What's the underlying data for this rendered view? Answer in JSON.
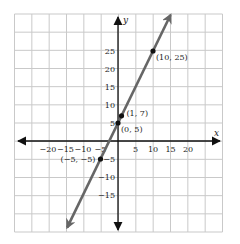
{
  "chart_data": {
    "type": "line",
    "title": "",
    "xlabel": "x",
    "ylabel": "y",
    "xlim": [
      -29,
      30
    ],
    "ylim": [
      -26,
      36
    ],
    "grid": true,
    "legend": null,
    "x_ticks": [
      -20,
      -15,
      -10,
      -5,
      5,
      10,
      15,
      20
    ],
    "x_tick_labels": [
      "−20",
      "−15",
      "−10",
      "−5",
      "5",
      "10",
      "15",
      "20"
    ],
    "y_ticks": [
      -15,
      -10,
      -5,
      5,
      10,
      15,
      20,
      25
    ],
    "y_tick_labels": [
      "−15",
      "−10",
      "−5",
      "5",
      "10",
      "15",
      "20",
      "25"
    ],
    "series": [
      {
        "name": "y = 2x + 5",
        "equation": "y = 2x + 5",
        "color": "#666666",
        "x": [
          -14.5,
          -5,
          0,
          1,
          10,
          15
        ],
        "y": [
          -24,
          -5,
          5,
          7,
          25,
          35
        ],
        "arrows": "both"
      }
    ],
    "points": [
      {
        "x": -5,
        "y": -5,
        "label": "(−5, −5)"
      },
      {
        "x": 0,
        "y": 5,
        "label": "(0, 5)"
      },
      {
        "x": 1,
        "y": 7,
        "label": "(1, 7)"
      },
      {
        "x": 10,
        "y": 25,
        "label": "(10, 25)"
      }
    ]
  },
  "colors": {
    "grid": "#c9c9c9",
    "axis": "#111111",
    "line": "#666666",
    "point": "#111111",
    "background": "#ffffff"
  }
}
